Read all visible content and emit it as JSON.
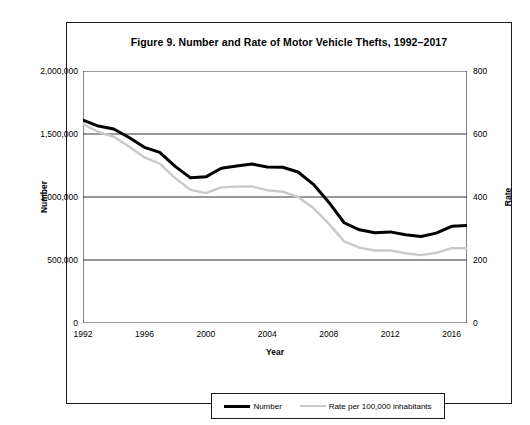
{
  "figure": {
    "title": "Figure 9. Number and Rate of Motor Vehicle Thefts, 1992–2017"
  },
  "axes": {
    "left_label": "Number",
    "right_label": "Rate",
    "x_label": "Year",
    "left_ticks": [
      "0",
      "500,000",
      "1,000,000",
      "1,500,000",
      "2,000,000"
    ],
    "right_ticks": [
      "0",
      "200",
      "400",
      "600",
      "800"
    ],
    "x_ticks": [
      "1992",
      "1996",
      "2000",
      "2004",
      "2008",
      "2012",
      "2016"
    ]
  },
  "legend": {
    "number_label": "Number",
    "rate_label": "Rate per 100,000 inhabitants"
  },
  "colors": {
    "number_line": "#000000",
    "rate_line": "#c9c9c9",
    "grid": "#333333",
    "frame": "#1a1a1a"
  },
  "chart_data": {
    "type": "line",
    "title": "Figure 9. Number and Rate of Motor Vehicle Thefts, 1992–2017",
    "xlabel": "Year",
    "ylabel": "Number",
    "y2label": "Rate",
    "grid": true,
    "legend_position": "bottom",
    "xlim": [
      1992,
      2017
    ],
    "ylim": [
      0,
      2000000
    ],
    "y2lim": [
      0,
      800
    ],
    "x": [
      1992,
      1993,
      1994,
      1995,
      1996,
      1997,
      1998,
      1999,
      2000,
      2001,
      2002,
      2003,
      2004,
      2005,
      2006,
      2007,
      2008,
      2009,
      2010,
      2011,
      2012,
      2013,
      2014,
      2015,
      2016,
      2017
    ],
    "series": [
      {
        "name": "Number",
        "axis": "left",
        "color": "#000000",
        "values": [
          1610834,
          1563060,
          1539287,
          1472441,
          1394238,
          1354189,
          1242781,
          1152075,
          1160002,
          1228391,
          1246646,
          1261226,
          1237851,
          1235859,
          1198245,
          1100472,
          959059,
          795652,
          739565,
          716508,
          723186,
          700294,
          686803,
          713063,
          767290,
          773139
        ]
      },
      {
        "name": "Rate per 100,000 inhabitants",
        "axis": "right",
        "color": "#c9c9c9",
        "values": [
          631.6,
          606.3,
          591.3,
          560.3,
          525.7,
          505.7,
          459.9,
          422.5,
          412.2,
          430.5,
          432.9,
          433.7,
          421.5,
          416.8,
          400.0,
          364.9,
          315.4,
          259.2,
          239.1,
          230.0,
          230.4,
          221.3,
          215.4,
          222.5,
          237.4,
          237.7
        ]
      }
    ]
  }
}
